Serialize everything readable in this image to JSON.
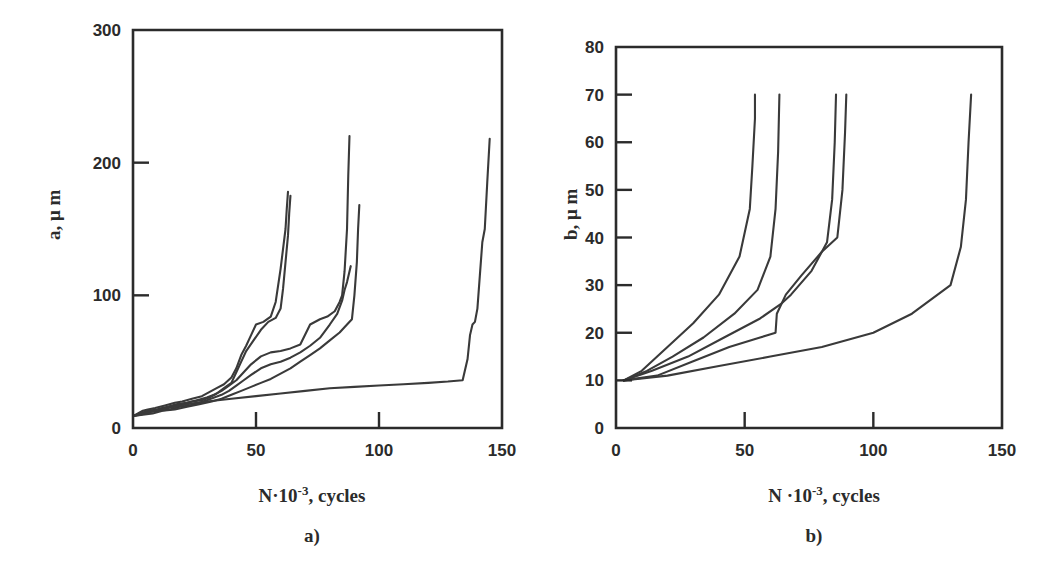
{
  "figure": {
    "background_color": "#ffffff",
    "line_color": "#3a3a3a",
    "axis_color": "#2b2b2b",
    "panels": [
      {
        "id": "a",
        "caption": "a)",
        "ylabel_prefix": "a, ",
        "ylabel_mu": "μ",
        "ylabel_suffix": "m",
        "xlabel_n": "N·10",
        "xlabel_exp": "-3",
        "xlabel_tail": ", cycles"
      },
      {
        "id": "b",
        "caption": "b)",
        "ylabel_prefix": "b, ",
        "ylabel_mu": "μ",
        "ylabel_suffix": "m",
        "xlabel_n": "N ·10",
        "xlabel_exp": "-3",
        "xlabel_tail": ",  cycles"
      }
    ]
  },
  "chart_data": [
    {
      "id": "chart-a",
      "type": "line",
      "title": "",
      "caption": "a)",
      "xlabel": "N·10^-3, cycles",
      "ylabel": "a, μm",
      "xlim": [
        0,
        150
      ],
      "ylim": [
        0,
        300
      ],
      "xticks": [
        0,
        50,
        100,
        150
      ],
      "yticks": [
        0,
        100,
        200,
        300
      ],
      "xtick_labels": [
        "0",
        "50",
        "100",
        "150"
      ],
      "ytick_labels": [
        "0",
        "100",
        "200",
        "300"
      ],
      "grid": false,
      "legend": "none",
      "series": [
        {
          "name": "specimen-1",
          "x": [
            0,
            2,
            4,
            6,
            9,
            13,
            17,
            20,
            24,
            28,
            31,
            34,
            37,
            40,
            42,
            44,
            46,
            48,
            50,
            53,
            56,
            58,
            60,
            61,
            62,
            62.5,
            63
          ],
          "y": [
            9,
            11,
            13,
            14,
            15,
            17,
            19,
            20,
            22,
            24,
            27,
            30,
            33,
            38,
            45,
            55,
            62,
            70,
            78,
            80,
            84,
            95,
            120,
            135,
            150,
            165,
            178
          ]
        },
        {
          "name": "specimen-2",
          "x": [
            0,
            2,
            5,
            8,
            12,
            16,
            20,
            24,
            28,
            31,
            34,
            37,
            40,
            42,
            44,
            46,
            49,
            52,
            55,
            58,
            60,
            61,
            62,
            63,
            63.5,
            64
          ],
          "y": [
            9,
            10,
            12,
            13,
            15,
            16,
            18,
            20,
            21,
            23,
            26,
            30,
            34,
            42,
            50,
            58,
            66,
            74,
            80,
            83,
            90,
            105,
            125,
            145,
            162,
            175
          ]
        },
        {
          "name": "specimen-3",
          "x": [
            0,
            3,
            6,
            10,
            14,
            18,
            22,
            26,
            30,
            33,
            36,
            39,
            42,
            45,
            48,
            52,
            56,
            60,
            64,
            68,
            72,
            76,
            79,
            82,
            84,
            85,
            86,
            87,
            87.5,
            88
          ],
          "y": [
            9,
            11,
            13,
            14,
            16,
            18,
            19,
            21,
            23,
            25,
            28,
            32,
            36,
            42,
            48,
            54,
            57,
            58,
            60,
            63,
            78,
            82,
            84,
            88,
            95,
            100,
            118,
            150,
            190,
            220
          ]
        },
        {
          "name": "specimen-4",
          "x": [
            0,
            3,
            7,
            11,
            15,
            19,
            23,
            27,
            30,
            33,
            36,
            39,
            42,
            45,
            48,
            52,
            56,
            60,
            64,
            68,
            72,
            76,
            80,
            83,
            85,
            86,
            87,
            88,
            88.5
          ],
          "y": [
            9,
            10,
            12,
            13,
            14,
            16,
            17,
            19,
            21,
            23,
            25,
            28,
            32,
            36,
            40,
            45,
            48,
            50,
            53,
            57,
            62,
            68,
            78,
            86,
            96,
            104,
            110,
            118,
            122
          ]
        },
        {
          "name": "specimen-5",
          "x": [
            0,
            4,
            8,
            12,
            17,
            22,
            27,
            32,
            36,
            40,
            44,
            48,
            52,
            56,
            60,
            64,
            68,
            72,
            76,
            80,
            84,
            87,
            89,
            90,
            91,
            91.5,
            92
          ],
          "y": [
            9,
            10,
            11,
            13,
            14,
            16,
            18,
            20,
            22,
            25,
            28,
            31,
            34,
            37,
            41,
            45,
            50,
            55,
            60,
            66,
            72,
            78,
            82,
            100,
            125,
            150,
            168
          ]
        },
        {
          "name": "specimen-6",
          "x": [
            0,
            6,
            14,
            22,
            30,
            40,
            50,
            60,
            70,
            80,
            90,
            100,
            110,
            120,
            128,
            134,
            136,
            137,
            138,
            139,
            140,
            141,
            142,
            143,
            144,
            145
          ],
          "y": [
            9,
            12,
            15,
            18,
            20,
            22,
            24,
            26,
            28,
            30,
            31,
            32,
            33,
            34,
            35,
            36,
            52,
            70,
            78,
            80,
            90,
            115,
            140,
            150,
            185,
            218
          ]
        }
      ]
    },
    {
      "id": "chart-b",
      "type": "line",
      "title": "",
      "caption": "b)",
      "xlabel": "N ·10^-3,  cycles",
      "ylabel": "b, μm",
      "xlim": [
        0,
        150
      ],
      "ylim": [
        0,
        80
      ],
      "xticks": [
        0,
        50,
        100,
        150
      ],
      "yticks": [
        0,
        10,
        20,
        30,
        40,
        50,
        60,
        70,
        80
      ],
      "xtick_labels": [
        "0",
        "50",
        "100",
        "150"
      ],
      "ytick_labels": [
        "0",
        "10",
        "20",
        "30",
        "40",
        "50",
        "60",
        "70",
        "80"
      ],
      "grid": false,
      "legend": "none",
      "series": [
        {
          "name": "specimen-1",
          "x": [
            3,
            10,
            20,
            30,
            40,
            48,
            52,
            53,
            54,
            54
          ],
          "y": [
            10,
            12,
            17,
            22,
            28,
            36,
            46,
            55,
            65,
            70
          ]
        },
        {
          "name": "specimen-2",
          "x": [
            3,
            12,
            22,
            34,
            46,
            55,
            60,
            62,
            63,
            63.5
          ],
          "y": [
            10,
            12,
            15,
            19,
            24,
            29,
            36,
            46,
            58,
            70
          ]
        },
        {
          "name": "specimen-3",
          "x": [
            3,
            14,
            28,
            42,
            56,
            64,
            68,
            76,
            82,
            84,
            85,
            85.5
          ],
          "y": [
            10,
            12,
            15,
            19,
            23,
            26,
            28,
            33,
            39,
            48,
            60,
            70
          ]
        },
        {
          "name": "specimen-4",
          "x": [
            3,
            16,
            30,
            44,
            56,
            62,
            62.5,
            66,
            72,
            80,
            86,
            88,
            89,
            89.5
          ],
          "y": [
            10,
            11,
            14,
            17,
            19,
            20,
            24,
            28,
            32,
            37,
            40,
            50,
            62,
            70
          ]
        },
        {
          "name": "specimen-5",
          "x": [
            3,
            20,
            40,
            60,
            80,
            100,
            115,
            130,
            134,
            136,
            137,
            138
          ],
          "y": [
            10,
            11,
            13,
            15,
            17,
            20,
            24,
            30,
            38,
            48,
            60,
            70
          ]
        }
      ]
    }
  ]
}
